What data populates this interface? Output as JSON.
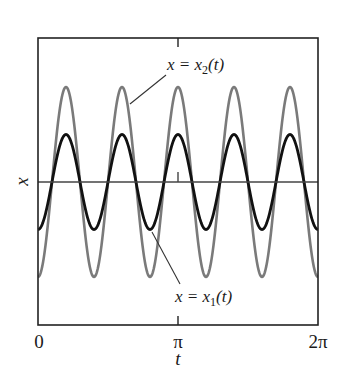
{
  "chart_data": {
    "type": "line",
    "title": "",
    "xlabel": "t",
    "ylabel": "x",
    "xlim": [
      0,
      6.2832
    ],
    "ylim": [
      -2.4,
      2.4
    ],
    "xticks": [
      {
        "value": 0,
        "label": "0"
      },
      {
        "value": 3.1416,
        "label": "π"
      },
      {
        "value": 6.2832,
        "label": "2π"
      }
    ],
    "yticks": [],
    "grid": false,
    "legend": "none (curves labeled by annotations)",
    "series": [
      {
        "name": "x2(t)",
        "formula": "x = -2·cos(5t)",
        "amplitude": 2.0,
        "frequency": 5,
        "color": "#7a7a7a",
        "width": 2.6
      },
      {
        "name": "x1(t)",
        "formula": "x = -1·cos(5t)",
        "amplitude": 1.0,
        "frequency": 5,
        "color": "#111111",
        "width": 2.8
      }
    ],
    "reference_lines": [
      {
        "type": "horizontal",
        "y": 0,
        "color": "#444444"
      }
    ],
    "annotations": [
      {
        "text": "x = x2(t)",
        "target": "x2(t)",
        "label_pos": "upper middle",
        "points_to_t": 1.035
      },
      {
        "text": "x = x1(t)",
        "target": "x1(t)",
        "label_pos": "lower middle",
        "points_to_t": 2.553
      }
    ]
  },
  "labels": {
    "tick_0": "0",
    "tick_pi": "π",
    "tick_2pi": "2π",
    "xlabel": "t",
    "ylabel": "x",
    "anno_x2_prefix": "x = x",
    "anno_x2_sub": "2",
    "anno_x2_suffix": "(t)",
    "anno_x1_prefix": "x = x",
    "anno_x1_sub": "1",
    "anno_x1_suffix": "(t)"
  }
}
